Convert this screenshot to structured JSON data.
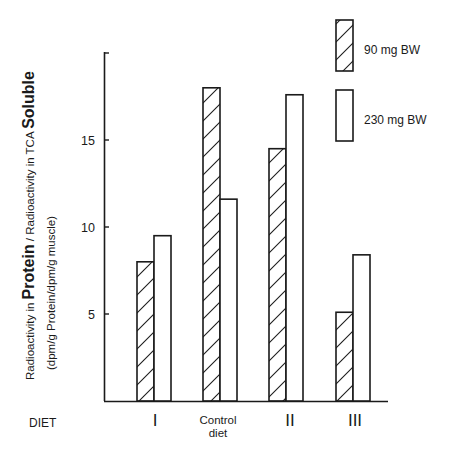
{
  "chart_data": {
    "type": "bar",
    "title": "",
    "xlabel": "DIET",
    "ylabel": {
      "line1_parts": [
        {
          "text": "Radioactivity  in ",
          "size": "small"
        },
        {
          "text": "Protein",
          "size": "large"
        },
        {
          "text": " / Radioactivity in TCA ",
          "size": "small"
        },
        {
          "text": "Soluble",
          "size": "large"
        }
      ],
      "line2": "(dpm/g Protein/dpm/g muscle)"
    },
    "categories": [
      "I",
      "Control diet",
      "II",
      "III"
    ],
    "category_labels": [
      {
        "lines": [
          "I"
        ],
        "roman": true
      },
      {
        "lines": [
          "Control",
          "diet"
        ],
        "roman": false
      },
      {
        "lines": [
          "II"
        ],
        "roman": true
      },
      {
        "lines": [
          "III"
        ],
        "roman": true
      }
    ],
    "series": [
      {
        "name": "90 mg BW",
        "pattern": "hatched",
        "values": [
          8.0,
          18.0,
          14.5,
          5.1
        ]
      },
      {
        "name": "230 mg BW",
        "pattern": "open",
        "values": [
          9.5,
          11.6,
          17.6,
          8.4
        ]
      }
    ],
    "yticks": [
      5,
      10,
      15,
      20
    ],
    "ytick_labels": [
      "5",
      "10",
      "15",
      ""
    ],
    "ylim": [
      0,
      20
    ],
    "grid": false,
    "legend_position": "top-right",
    "colors": {
      "ink": "#1a1a1a",
      "background": "#ffffff"
    }
  }
}
